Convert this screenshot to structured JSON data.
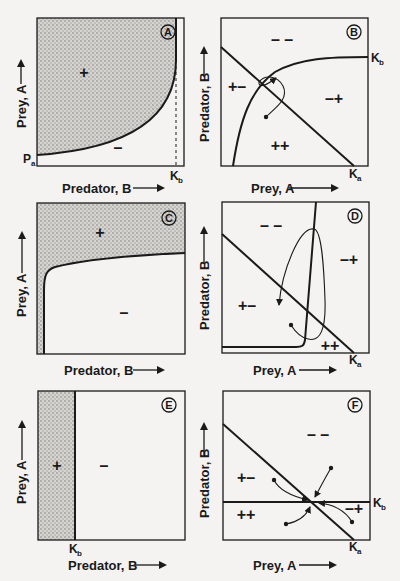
{
  "colors": {
    "background": "#f4f3f1",
    "ink": "#1a1a1a",
    "stipple": "#8c8a88"
  },
  "panels": [
    {
      "id": "A",
      "badge": "A",
      "x_label": "Predator, B",
      "y_label": "Prey, A",
      "region_labels": [
        {
          "text": "+",
          "shaded": true
        },
        {
          "text": "–",
          "shaded": false
        }
      ],
      "axis_markers": [
        {
          "text": "P",
          "sub": "a",
          "position": "left-bottom"
        },
        {
          "text": "K",
          "sub": "b",
          "position": "bottom",
          "dashed_line": true
        }
      ]
    },
    {
      "id": "B",
      "badge": "B",
      "x_label": "Prey, A",
      "y_label": "Predator, B",
      "region_labels": [
        {
          "text": "– –"
        },
        {
          "text": "+–"
        },
        {
          "text": "–+"
        },
        {
          "text": "++"
        }
      ],
      "axis_markers": [
        {
          "text": "K",
          "sub": "b",
          "position": "right"
        },
        {
          "text": "K",
          "sub": "a",
          "position": "bottom"
        }
      ]
    },
    {
      "id": "C",
      "badge": "C",
      "x_label": "Predator, B",
      "y_label": "Prey, A",
      "region_labels": [
        {
          "text": "+",
          "shaded": true
        },
        {
          "text": "–",
          "shaded": false
        }
      ]
    },
    {
      "id": "D",
      "badge": "D",
      "x_label": "Prey, A",
      "y_label": "Predator, B",
      "region_labels": [
        {
          "text": "– –"
        },
        {
          "text": "–+"
        },
        {
          "text": "+–"
        },
        {
          "text": "++"
        }
      ],
      "axis_markers": [
        {
          "text": "K",
          "sub": "a",
          "position": "bottom"
        }
      ]
    },
    {
      "id": "E",
      "badge": "E",
      "x_label": "Predator, B",
      "y_label": "Prey, A",
      "region_labels": [
        {
          "text": "+",
          "shaded": true
        },
        {
          "text": "–",
          "shaded": false
        }
      ],
      "axis_markers": [
        {
          "text": "K",
          "sub": "b",
          "position": "bottom"
        }
      ]
    },
    {
      "id": "F",
      "badge": "F",
      "x_label": "Prey, A",
      "y_label": "Predator, B",
      "region_labels": [
        {
          "text": "– –"
        },
        {
          "text": "+–"
        },
        {
          "text": "++"
        },
        {
          "text": "–+"
        }
      ],
      "axis_markers": [
        {
          "text": "K",
          "sub": "b",
          "position": "right"
        },
        {
          "text": "K",
          "sub": "a",
          "position": "bottom"
        }
      ]
    }
  ]
}
